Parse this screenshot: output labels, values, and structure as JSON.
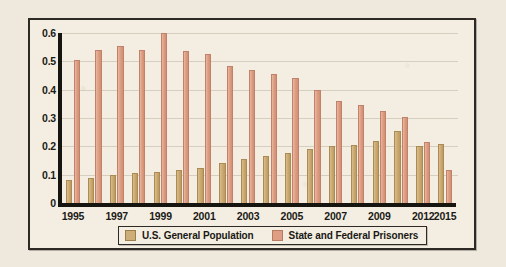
{
  "chart_data": {
    "type": "bar",
    "title": "",
    "subtitle": "",
    "xlabel": "",
    "ylabel": "",
    "ylim": [
      0,
      0.6
    ],
    "yticks": [
      "0",
      "0.1",
      "0.2",
      "0.3",
      "0.4",
      "0.5",
      "0.6"
    ],
    "ytick_values": [
      0,
      0.1,
      0.2,
      0.3,
      0.4,
      0.5,
      0.6
    ],
    "grid": true,
    "legend_position": "bottom",
    "categories": [
      "1995",
      "1996",
      "1997",
      "1998",
      "1999",
      "2000",
      "2001",
      "2002",
      "2003",
      "2004",
      "2005",
      "2006",
      "2007",
      "2008",
      "2009",
      "2010",
      "2012",
      "2015"
    ],
    "visible_tick_labels": [
      "1995",
      "1997",
      "1999",
      "2001",
      "2003",
      "2005",
      "2007",
      "2009",
      "2012",
      "2015"
    ],
    "series": [
      {
        "name": "U.S. General Population",
        "color": "#cdae78",
        "values": [
          0.08,
          0.09,
          0.1,
          0.105,
          0.11,
          0.115,
          0.125,
          0.14,
          0.155,
          0.165,
          0.175,
          0.19,
          0.2,
          0.205,
          0.22,
          0.255,
          0.2,
          0.21
        ]
      },
      {
        "name": "State and Federal Prisoners",
        "color": "#dd9e84",
        "values": [
          0.505,
          0.54,
          0.555,
          0.54,
          0.6,
          0.535,
          0.525,
          0.485,
          0.47,
          0.455,
          0.44,
          0.4,
          0.36,
          0.345,
          0.325,
          0.305,
          0.215,
          0.115
        ]
      }
    ]
  },
  "legend": {
    "items": [
      {
        "label": "U.S. General Population",
        "swatch": "pop"
      },
      {
        "label": "State and Federal Prisoners",
        "swatch": "pris"
      }
    ]
  },
  "colors": {
    "background": "#efe9dd",
    "panel": "#f4eee2",
    "frame": "#2d2a26",
    "axis": "#17150f",
    "population_bar": "#cdae78",
    "prisoner_bar": "#dd9e84",
    "text": "#1b1a16"
  }
}
